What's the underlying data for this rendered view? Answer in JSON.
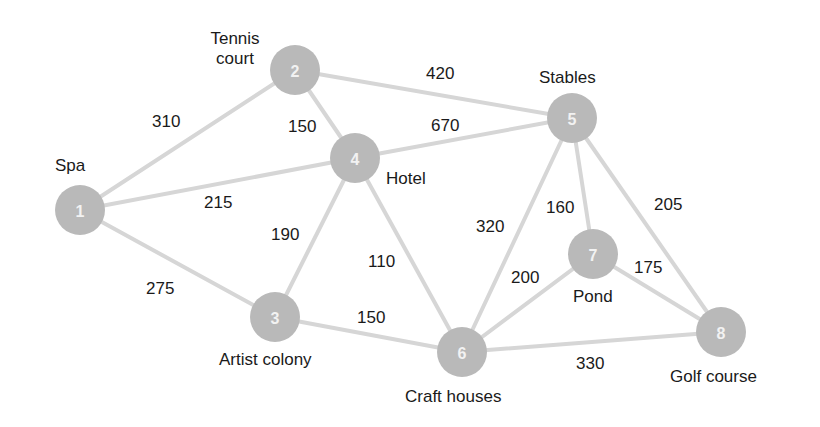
{
  "diagram": {
    "type": "weighted-undirected-graph",
    "nodes": [
      {
        "id": "1",
        "name": "Spa",
        "x": 80,
        "y": 210
      },
      {
        "id": "2",
        "name": "Tennis court",
        "name_lines": [
          "Tennis",
          "court"
        ],
        "x": 295,
        "y": 70
      },
      {
        "id": "3",
        "name": "Artist colony",
        "x": 275,
        "y": 317
      },
      {
        "id": "4",
        "name": "Hotel",
        "x": 355,
        "y": 158
      },
      {
        "id": "5",
        "name": "Stables",
        "x": 572,
        "y": 118
      },
      {
        "id": "6",
        "name": "Craft houses",
        "x": 462,
        "y": 352
      },
      {
        "id": "7",
        "name": "Pond",
        "x": 593,
        "y": 254
      },
      {
        "id": "8",
        "name": "Golf course",
        "x": 721,
        "y": 332
      }
    ],
    "edges": [
      {
        "from": "1",
        "to": "2",
        "weight": "310"
      },
      {
        "from": "1",
        "to": "4",
        "weight": "215"
      },
      {
        "from": "1",
        "to": "3",
        "weight": "275"
      },
      {
        "from": "2",
        "to": "4",
        "weight": "150"
      },
      {
        "from": "2",
        "to": "5",
        "weight": "420"
      },
      {
        "from": "4",
        "to": "5",
        "weight": "670"
      },
      {
        "from": "4",
        "to": "3",
        "weight": "190"
      },
      {
        "from": "4",
        "to": "6",
        "weight": "110"
      },
      {
        "from": "3",
        "to": "6",
        "weight": "150"
      },
      {
        "from": "5",
        "to": "6",
        "weight": "320"
      },
      {
        "from": "5",
        "to": "7",
        "weight": "160"
      },
      {
        "from": "5",
        "to": "8",
        "weight": "205"
      },
      {
        "from": "7",
        "to": "6",
        "weight": "200"
      },
      {
        "from": "7",
        "to": "8",
        "weight": "175"
      },
      {
        "from": "6",
        "to": "8",
        "weight": "330"
      }
    ],
    "colors": {
      "node_fill": "#b9b9b9",
      "node_number": "#f2f2f2",
      "edge": "#d6d6d6",
      "text": "#1a1a1a"
    }
  }
}
